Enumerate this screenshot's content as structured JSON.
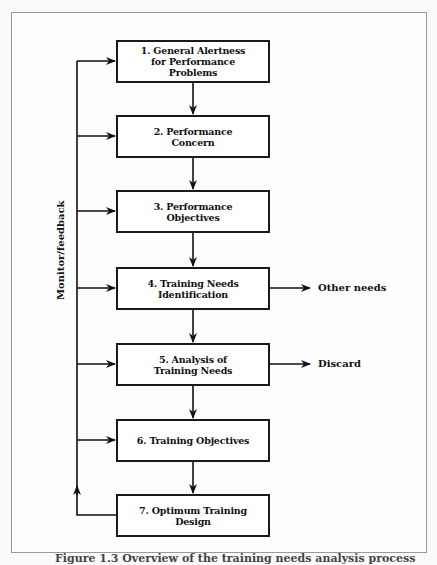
{
  "diagram": {
    "steps": [
      {
        "label": "1. General Alertness for Performance Problems",
        "lines": [
          "1. General Alertness",
          "for Performance",
          "Problems"
        ]
      },
      {
        "label": "2. Performance Concern",
        "lines": [
          "2. Performance",
          "Concern"
        ]
      },
      {
        "label": "3. Performance Objectives",
        "lines": [
          "3. Performance",
          "Objectives"
        ]
      },
      {
        "label": "4. Training Needs Identification",
        "lines": [
          "4. Training Needs",
          "Identification"
        ]
      },
      {
        "label": "5. Analysis of Training Needs",
        "lines": [
          "5. Analysis of",
          "Training Needs"
        ]
      },
      {
        "label": "6. Training Objectives",
        "lines": [
          "6. Training Objectives"
        ]
      },
      {
        "label": "7. Optimum Training Design",
        "lines": [
          "7. Optimum Training",
          "Design"
        ]
      }
    ],
    "side_outputs": [
      {
        "from_step": 4,
        "label": "Other needs"
      },
      {
        "from_step": 5,
        "label": "Discard"
      }
    ],
    "feedback_loop": {
      "label": "Monitor/feedback",
      "from_step": 7,
      "to_steps": [
        1,
        2,
        3,
        4,
        5,
        6
      ]
    },
    "caption": "Figure 1.3 Overview of the training needs analysis process"
  }
}
